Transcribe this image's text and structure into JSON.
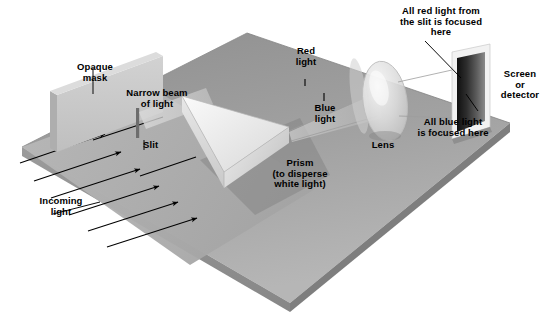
{
  "diagram": {
    "type": "optics-ray-diagram"
  },
  "labels": {
    "opaque_mask": "Opaque\nmask",
    "narrow_beam": "Narrow beam\nof light",
    "slit": "Slit",
    "incoming_light": "Incoming\nlight",
    "prism": "Prism\n(to disperse\nwhite light)",
    "red_light": "Red\nlight",
    "blue_light": "Blue\nlight",
    "lens": "Lens",
    "red_focus": "All red light from\nthe slit is focused\nhere",
    "blue_focus": "All blue light\nis focused here",
    "screen": "Screen\nor\ndetector"
  },
  "colors": {
    "base_top": "#9a9a9a",
    "base_top_light": "#b4b4b4",
    "base_front": "#8d8d8d",
    "base_edge": "#707070",
    "mask_face": "#c8c8c8",
    "mask_side": "#b0b0b0",
    "prism_light": "#f2f2f2",
    "prism_mid": "#dcdcdc",
    "prism_dark": "#c2c2c2",
    "lens_glass": "#e2e2e2",
    "screen_frame": "#f0f0f0",
    "screen_dark": "#2a2a2a",
    "line": "#000000",
    "text": "#000000"
  },
  "elements": {
    "base_platform": "rectangular table in 3D perspective",
    "arrow_count": 6,
    "slit_bar": "dark vertical bar in mask",
    "screen_gradient": "dark spectrum band from black to grey",
    "icons": {
      "arrowhead": "arrow-head-icon",
      "leader": "leader-line-icon",
      "tick": "tick-mark-icon"
    }
  }
}
